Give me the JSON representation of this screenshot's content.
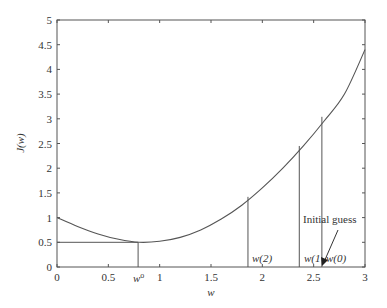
{
  "chart_data": {
    "type": "line",
    "title": "",
    "xlabel": "w",
    "ylabel": "J(w)",
    "xlim": [
      0,
      3
    ],
    "ylim": [
      0,
      5
    ],
    "xticks": [
      "0",
      "0.5",
      "1",
      "1.5",
      "2",
      "2.5",
      "3"
    ],
    "yticks": [
      "0",
      "0.5",
      "1",
      "1.5",
      "2",
      "2.5",
      "3",
      "3.5",
      "4",
      "4.5",
      "5"
    ],
    "grid": false,
    "series": [
      {
        "name": "J(w)",
        "x": [
          0,
          0.2,
          0.4,
          0.6,
          0.8,
          1.0,
          1.2,
          1.4,
          1.6,
          1.8,
          2.0,
          2.2,
          2.4,
          2.6,
          2.8,
          3.0
        ],
        "y": [
          1.0,
          0.82,
          0.67,
          0.56,
          0.5,
          0.52,
          0.6,
          0.75,
          0.97,
          1.25,
          1.6,
          2.0,
          2.45,
          2.95,
          3.5,
          4.4
        ]
      }
    ],
    "markers": [
      {
        "label": "w^o",
        "x": 0.79,
        "y": 0.5,
        "horizontal_to_axis": true
      },
      {
        "label": "w(2)",
        "x": 1.86,
        "y": 1.42
      },
      {
        "label": "w(1)",
        "x": 2.36,
        "y": 2.45
      },
      {
        "label": "w(0)",
        "x": 2.58,
        "y": 3.04
      }
    ],
    "annotations": [
      {
        "text": "Initial guess",
        "arrow_to": "w(0)"
      }
    ]
  },
  "labels": {
    "xlabel": "w",
    "ylabel": "J(w)",
    "w_opt": "w",
    "w_opt_sup": "o",
    "w2": "w(2)",
    "w1": "w(1",
    "w0": "w(0)",
    "initial_guess": "Initial guess"
  }
}
